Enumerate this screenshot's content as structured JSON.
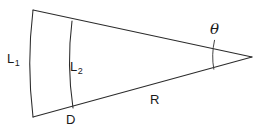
{
  "figure": {
    "kind": "annular-sector-geometry-diagram",
    "background_color": "#ffffff",
    "line_color": "#2b2b2b",
    "text_color": "#1a1a1a",
    "width": 259,
    "height": 130
  },
  "labels": {
    "outer_arc": {
      "text": "L",
      "subscript": "1",
      "name": "outer-arc-length"
    },
    "inner_arc": {
      "text": "L",
      "subscript": "2",
      "name": "inner-arc-length"
    },
    "radius": {
      "text": "R",
      "name": "radius"
    },
    "depth": {
      "text": "D",
      "name": "depth"
    },
    "angle": {
      "text": "θ",
      "name": "apex-angle"
    }
  },
  "geometry": {
    "apex": {
      "x": 252,
      "y": 57
    },
    "outer_arc": {
      "start": {
        "x": 33,
        "y": 10
      },
      "end": {
        "x": 33,
        "y": 117
      },
      "bulge_x": 27
    },
    "inner_arc": {
      "start": {
        "x": 72,
        "y": 21
      },
      "end": {
        "x": 73,
        "y": 108
      },
      "bulge_x": 67
    },
    "upper_ray": {
      "from": {
        "x": 33,
        "y": 10
      },
      "to": {
        "x": 252,
        "y": 57
      }
    },
    "lower_ray": {
      "from": {
        "x": 33,
        "y": 117
      },
      "to": {
        "x": 252,
        "y": 57
      }
    },
    "angle_arc": {
      "start": {
        "x": 214,
        "y": 40
      },
      "end": {
        "x": 214,
        "y": 69
      },
      "bulge_x": 211
    }
  }
}
